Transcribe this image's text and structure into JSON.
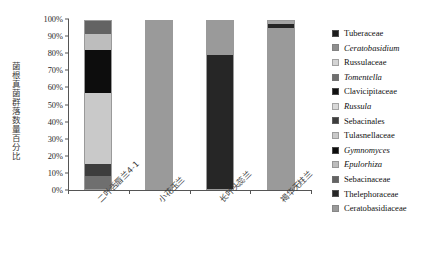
{
  "chart_data": {
    "type": "bar",
    "subtype": "stacked-100-percent",
    "title": "",
    "xlabel": "",
    "ylabel": "菌根真菌群落数量百分比",
    "ylim": [
      0,
      100
    ],
    "ytick_labels": [
      "100%",
      "90%",
      "80%",
      "70%",
      "60%",
      "50%",
      "40%",
      "30%",
      "20%",
      "10%",
      "0%"
    ],
    "ytick_values": [
      100,
      90,
      80,
      70,
      60,
      50,
      40,
      30,
      20,
      10,
      0
    ],
    "grid": false,
    "legend_position": "right",
    "categories": [
      "二叶舌唇兰4-1",
      "小花玉兰",
      "长叶头蕊兰",
      "褐华无柱兰"
    ],
    "series": [
      {
        "name": "Tuberaceae",
        "italic": false,
        "color": "#1c1c1c",
        "values": [
          0,
          0,
          0,
          0
        ]
      },
      {
        "name": "Ceratobasidium",
        "italic": true,
        "color": "#8e8e8e",
        "values": [
          0,
          0,
          0,
          0
        ]
      },
      {
        "name": "Russulaceae",
        "italic": false,
        "color": "#d4d4d4",
        "values": [
          0,
          0,
          0,
          0
        ]
      },
      {
        "name": "Tomentella",
        "italic": true,
        "color": "#6f6f6f",
        "values": [
          8,
          0,
          0,
          0
        ]
      },
      {
        "name": "Clavicipitaceae",
        "italic": false,
        "color": "#111111",
        "values": [
          0,
          0,
          0,
          0
        ]
      },
      {
        "name": "Russula",
        "italic": true,
        "color": "#d9d9d9",
        "values": [
          0,
          0,
          0,
          0
        ]
      },
      {
        "name": "Sebacinales",
        "italic": false,
        "color": "#3d3d3d",
        "values": [
          7,
          0,
          0,
          0
        ]
      },
      {
        "name": "Tulasnellaceae",
        "italic": false,
        "color": "#c9c9c9",
        "values": [
          42,
          0,
          0,
          0
        ]
      },
      {
        "name": "Gymnomyces",
        "italic": true,
        "color": "#0d0d0d",
        "values": [
          26,
          0,
          0,
          0
        ]
      },
      {
        "name": "Epulorhiza",
        "italic": true,
        "color": "#bdbdbd",
        "values": [
          9,
          0,
          0,
          0
        ]
      },
      {
        "name": "Sebacinaceae",
        "italic": false,
        "color": "#636363",
        "values": [
          8,
          0,
          0,
          0
        ]
      },
      {
        "name": "Thelephoraceae",
        "italic": false,
        "color": "#262626",
        "values": [
          0,
          0,
          80,
          2
        ]
      },
      {
        "name": "Ceratobasidiaceae",
        "italic": false,
        "color": "#9a9a9a",
        "values": [
          0,
          100,
          20,
          98
        ]
      }
    ],
    "bars": [
      {
        "category": "二叶舌唇兰4-1",
        "segments": [
          {
            "name": "Tomentella",
            "color": "#6f6f6f",
            "value": 8
          },
          {
            "name": "Sebacinales",
            "color": "#3d3d3d",
            "value": 7
          },
          {
            "name": "Tulasnellaceae",
            "color": "#c9c9c9",
            "value": 42
          },
          {
            "name": "Gymnomyces",
            "color": "#0d0d0d",
            "value": 26
          },
          {
            "name": "Epulorhiza",
            "color": "#bdbdbd",
            "value": 9
          },
          {
            "name": "Sebacinaceae",
            "color": "#636363",
            "value": 8
          }
        ]
      },
      {
        "category": "小花玉兰",
        "segments": [
          {
            "name": "Ceratobasidiaceae",
            "color": "#9a9a9a",
            "value": 100
          }
        ]
      },
      {
        "category": "长叶头蕊兰",
        "segments": [
          {
            "name": "Thelephoraceae",
            "color": "#262626",
            "value": 80
          },
          {
            "name": "Ceratobasidiaceae",
            "color": "#9a9a9a",
            "value": 20
          }
        ]
      },
      {
        "category": "褐华无柱兰",
        "segments": [
          {
            "name": "Ceratobasidiaceae",
            "color": "#9a9a9a",
            "value": 96
          },
          {
            "name": "Thelephoraceae",
            "color": "#262626",
            "value": 2
          },
          {
            "name": "Ceratobasidium",
            "color": "#a5a5a5",
            "value": 2
          }
        ]
      }
    ]
  }
}
